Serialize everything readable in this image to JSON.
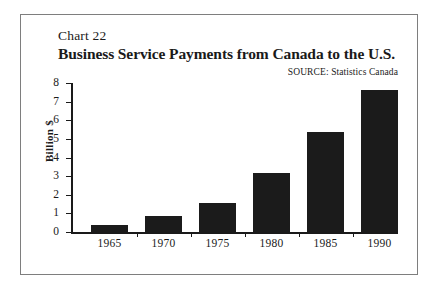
{
  "figure": {
    "chart_number": "Chart 22",
    "title": "Business Service Payments from Canada to the U.S.",
    "source_label": "SOURCE:",
    "source_value": "Statistics Canada",
    "border_color": "#7e7e7e",
    "bar_color": "#1b1b1b",
    "background": "#ffffff"
  },
  "chart_data": {
    "type": "bar",
    "title": "Business Service Payments from Canada to the U.S.",
    "subtitle": "Chart 22",
    "source": "SOURCE: Statistics Canada",
    "xlabel": "",
    "ylabel": "Billion $",
    "categories": [
      "1965",
      "1970",
      "1975",
      "1980",
      "1985",
      "1990"
    ],
    "values": [
      0.4,
      0.85,
      1.55,
      3.15,
      5.35,
      7.6
    ],
    "ylim": [
      0,
      8
    ],
    "yticks": [
      0,
      1,
      2,
      3,
      4,
      5,
      6,
      7,
      8
    ],
    "ytick_labels": [
      "0",
      "1",
      "2",
      "3",
      "4",
      "5",
      "6",
      "7",
      "8"
    ],
    "grid": false,
    "legend": false
  }
}
